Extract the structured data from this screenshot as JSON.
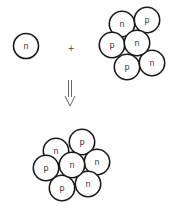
{
  "diagram": {
    "colors": {
      "outline": "#1a1a1a",
      "fill": "#ffffff",
      "label": "#333333"
    },
    "reactant_neutron": {
      "label": "n",
      "cx": 26,
      "cy": 46,
      "r": 12.5
    },
    "plus": {
      "label": "+",
      "x": 71,
      "y": 48
    },
    "reactant_nucleus": {
      "nucleons": [
        {
          "label": "n",
          "cx": 122,
          "cy": 24
        },
        {
          "label": "p",
          "cx": 147,
          "cy": 20
        },
        {
          "label": "p",
          "cx": 112,
          "cy": 45
        },
        {
          "label": "n",
          "cx": 137,
          "cy": 43
        },
        {
          "label": "p",
          "cx": 127,
          "cy": 67
        },
        {
          "label": "n",
          "cx": 152,
          "cy": 63
        }
      ],
      "r": 12.7
    },
    "arrow": {
      "type": "double-shaft-down",
      "x": 70,
      "y_start": 80,
      "y_end": 106
    },
    "product_nucleus": {
      "nucleons": [
        {
          "label": "n",
          "cx": 56,
          "cy": 151
        },
        {
          "label": "p",
          "cx": 82,
          "cy": 142
        },
        {
          "label": "p",
          "cx": 46,
          "cy": 168
        },
        {
          "label": "n",
          "cx": 72,
          "cy": 165
        },
        {
          "label": "n",
          "cx": 97,
          "cy": 162
        },
        {
          "label": "p",
          "cx": 62,
          "cy": 188
        },
        {
          "label": "n",
          "cx": 88,
          "cy": 184
        }
      ],
      "r": 12.7
    }
  }
}
